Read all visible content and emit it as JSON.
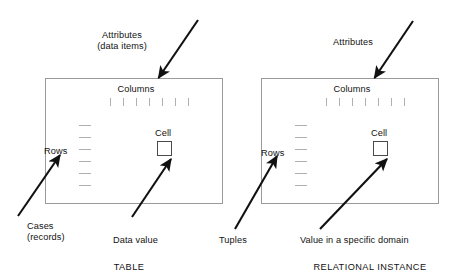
{
  "figure": {
    "width": 453,
    "height": 279,
    "background": "#ffffff",
    "stroke_color": "#111111",
    "box_border_color": "#999999"
  },
  "panels": [
    {
      "id": "table-panel",
      "caption": "TABLE",
      "box": {
        "x": 45,
        "y": 78,
        "width": 177,
        "height": 125
      },
      "inside_labels": {
        "columns": "Columns",
        "rows": "Rows",
        "cell": "Cell"
      },
      "column_ticks": {
        "count": 7,
        "start_x": 110,
        "spacing": 13,
        "y": 98,
        "length": 8
      },
      "row_dashes": {
        "count": 6,
        "x": 79,
        "start_y": 125,
        "spacing": 12,
        "length": 12
      },
      "cell_box": {
        "x": 157,
        "y": 141,
        "size": 14
      },
      "outside_labels": {
        "top": "Attributes\n(data items)",
        "bottom_left": "Cases\n(records)",
        "bottom_right": "Data value"
      },
      "arrows": [
        {
          "name": "attributes-arrow",
          "from_x": 198,
          "from_y": 20,
          "to_x": 157,
          "to_y": 79
        },
        {
          "name": "cases-arrow",
          "from_x": 18,
          "from_y": 216,
          "to_x": 61,
          "to_y": 154
        },
        {
          "name": "data-value-arrow",
          "from_x": 132,
          "from_y": 217,
          "to_x": 172,
          "to_y": 158
        }
      ]
    },
    {
      "id": "relational-instance-panel",
      "caption": "RELATIONAL INSTANCE",
      "box": {
        "x": 261,
        "y": 78,
        "width": 177,
        "height": 125
      },
      "inside_labels": {
        "columns": "Columns",
        "rows": "Rows",
        "cell": "Cell"
      },
      "column_ticks": {
        "count": 7,
        "start_x": 326,
        "spacing": 13,
        "y": 98,
        "length": 8
      },
      "row_dashes": {
        "count": 6,
        "x": 295,
        "start_y": 125,
        "spacing": 12,
        "length": 12
      },
      "cell_box": {
        "x": 373,
        "y": 141,
        "size": 14
      },
      "outside_labels": {
        "top": "Attributes",
        "bottom_left": "Tuples",
        "bottom_right": "Value in a specific domain"
      },
      "arrows": [
        {
          "name": "attributes-arrow",
          "from_x": 413,
          "from_y": 21,
          "to_x": 373,
          "to_y": 79
        },
        {
          "name": "tuples-arrow",
          "from_x": 235,
          "from_y": 228,
          "to_x": 278,
          "to_y": 155
        },
        {
          "name": "domain-value-arrow",
          "from_x": 320,
          "from_y": 228,
          "to_x": 388,
          "to_y": 158
        }
      ]
    }
  ],
  "text": {
    "attributes_left": "Attributes\n(data items)",
    "attributes_right": "Attributes",
    "columns_left": "Columns",
    "columns_right": "Columns",
    "rows_left": "Rows",
    "rows_right": "Rows",
    "cell_left": "Cell",
    "cell_right": "Cell",
    "cases_left": "Cases\n(records)",
    "data_value_left": "Data value",
    "tuples_right": "Tuples",
    "domain_value_right": "Value in a specific domain",
    "caption_left": "TABLE",
    "caption_right": "RELATIONAL INSTANCE"
  }
}
